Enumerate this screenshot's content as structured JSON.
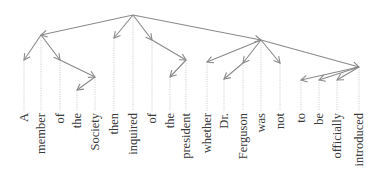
{
  "diagram": {
    "type": "dependency-parse",
    "root": "inquired",
    "colors": {
      "arc": "#8a8a8a",
      "guide": "#c4c4c4",
      "text": "#3a3a3a"
    },
    "words": [
      {
        "id": 0,
        "text": "A",
        "x": 24,
        "node_y": 60
      },
      {
        "id": 1,
        "text": "member",
        "x": 41,
        "node_y": 35
      },
      {
        "id": 2,
        "text": "of",
        "x": 60,
        "node_y": 60
      },
      {
        "id": 3,
        "text": "the",
        "x": 77,
        "node_y": 90
      },
      {
        "id": 4,
        "text": "Society",
        "x": 95,
        "node_y": 77
      },
      {
        "id": 5,
        "text": "then",
        "x": 114,
        "node_y": 38
      },
      {
        "id": 6,
        "text": "inquired",
        "x": 133,
        "node_y": 15
      },
      {
        "id": 7,
        "text": "of",
        "x": 152,
        "node_y": 40
      },
      {
        "id": 8,
        "text": "the",
        "x": 170,
        "node_y": 77
      },
      {
        "id": 9,
        "text": "president",
        "x": 186,
        "node_y": 60
      },
      {
        "id": 10,
        "text": "whether",
        "x": 207,
        "node_y": 62
      },
      {
        "id": 11,
        "text": "Dr.",
        "x": 224,
        "node_y": 79
      },
      {
        "id": 12,
        "text": "Ferguson",
        "x": 243,
        "node_y": 63
      },
      {
        "id": 13,
        "text": "was",
        "x": 261,
        "node_y": 40
      },
      {
        "id": 14,
        "text": "not",
        "x": 280,
        "node_y": 63
      },
      {
        "id": 15,
        "text": "to",
        "x": 301,
        "node_y": 80
      },
      {
        "id": 16,
        "text": "be",
        "x": 319,
        "node_y": 80
      },
      {
        "id": 17,
        "text": "officially",
        "x": 337,
        "node_y": 80
      },
      {
        "id": 18,
        "text": "introduced",
        "x": 359,
        "node_y": 67
      }
    ],
    "edges": [
      {
        "head": 6,
        "dep": 1
      },
      {
        "head": 6,
        "dep": 5
      },
      {
        "head": 6,
        "dep": 7
      },
      {
        "head": 6,
        "dep": 13
      },
      {
        "head": 1,
        "dep": 0
      },
      {
        "head": 1,
        "dep": 2
      },
      {
        "head": 2,
        "dep": 4
      },
      {
        "head": 4,
        "dep": 3
      },
      {
        "head": 7,
        "dep": 9
      },
      {
        "head": 9,
        "dep": 8
      },
      {
        "head": 13,
        "dep": 10
      },
      {
        "head": 13,
        "dep": 12
      },
      {
        "head": 12,
        "dep": 11
      },
      {
        "head": 13,
        "dep": 14
      },
      {
        "head": 13,
        "dep": 18
      },
      {
        "head": 18,
        "dep": 15
      },
      {
        "head": 18,
        "dep": 16
      },
      {
        "head": 18,
        "dep": 17
      }
    ],
    "label_top_y": 113,
    "guide_bottom_y": 111
  }
}
